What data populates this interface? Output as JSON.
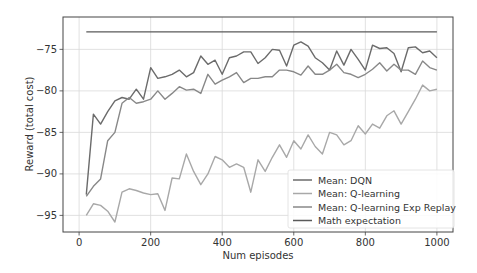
{
  "chart_data": {
    "type": "line",
    "title": "",
    "xlabel": "Num episodes",
    "ylabel": "Reward (total cost)",
    "xlim": [
      -45,
      1045
    ],
    "ylim": [
      -97,
      -71.1
    ],
    "xticks": [
      0,
      200,
      400,
      600,
      800,
      1000
    ],
    "yticks": [
      -95,
      -90,
      -85,
      -80,
      -75
    ],
    "grid": true,
    "legend_position": "lower right",
    "x": [
      20,
      40,
      60,
      80,
      100,
      120,
      140,
      160,
      180,
      200,
      220,
      240,
      260,
      280,
      300,
      320,
      340,
      360,
      380,
      400,
      420,
      440,
      460,
      480,
      500,
      520,
      540,
      560,
      580,
      600,
      620,
      640,
      660,
      680,
      700,
      720,
      740,
      760,
      780,
      800,
      820,
      840,
      860,
      880,
      900,
      920,
      940,
      960,
      980,
      1000
    ],
    "series": [
      {
        "name": "Mean: DQN",
        "color": "#6b6b6b",
        "values": [
          -92.5,
          -82.8,
          -84.0,
          -82.5,
          -81.2,
          -80.8,
          -81.0,
          -79.8,
          -81.0,
          -77.2,
          -78.5,
          -78.3,
          -78.0,
          -77.5,
          -78.3,
          -77.8,
          -75.8,
          -76.8,
          -76.3,
          -78.0,
          -76.0,
          -75.8,
          -75.3,
          -75.3,
          -76.7,
          -76.0,
          -75.0,
          -75.1,
          -77.0,
          -74.5,
          -74.1,
          -74.6,
          -76.0,
          -76.6,
          -77.5,
          -75.2,
          -76.9,
          -75.0,
          -76.2,
          -77.5,
          -74.5,
          -74.9,
          -74.8,
          -75.5,
          -77.7,
          -74.8,
          -74.7,
          -75.4,
          -75.2,
          -76.0
        ]
      },
      {
        "name": "Mean: Q-learning",
        "color": "#a8a8a8",
        "values": [
          -95.0,
          -93.6,
          -93.8,
          -94.5,
          -95.8,
          -92.2,
          -91.8,
          -92.0,
          -92.3,
          -92.5,
          -92.4,
          -94.4,
          -90.5,
          -90.6,
          -87.6,
          -89.7,
          -91.3,
          -90.0,
          -87.9,
          -88.3,
          -89.2,
          -88.8,
          -89.2,
          -92.2,
          -88.3,
          -89.7,
          -88.0,
          -86.5,
          -88.0,
          -86.0,
          -87.0,
          -85.3,
          -86.7,
          -87.6,
          -85.0,
          -85.3,
          -86.5,
          -86.0,
          -84.2,
          -85.2,
          -84.0,
          -84.5,
          -83.0,
          -82.4,
          -84.0,
          -82.5,
          -81.0,
          -79.3,
          -80.0,
          -79.8
        ]
      },
      {
        "name": "Mean: Q-learning Exp Replay",
        "color": "#888888",
        "values": [
          -92.7,
          -91.5,
          -90.6,
          -86.0,
          -85.0,
          -81.5,
          -80.8,
          -81.5,
          -81.3,
          -81.0,
          -80.0,
          -81.0,
          -80.3,
          -79.5,
          -79.9,
          -79.8,
          -80.3,
          -78.0,
          -79.2,
          -78.7,
          -78.3,
          -77.8,
          -79.0,
          -78.5,
          -78.5,
          -78.3,
          -78.3,
          -77.5,
          -77.5,
          -77.7,
          -78.1,
          -77.0,
          -78.0,
          -78.0,
          -77.5,
          -76.8,
          -77.8,
          -78.0,
          -78.4,
          -78.0,
          -77.4,
          -76.6,
          -77.6,
          -76.8,
          -77.5,
          -77.5,
          -78.0,
          -76.4,
          -77.2,
          -77.5
        ]
      },
      {
        "name": "Math expectation",
        "color": "#5a5a5a",
        "values": [
          -72.9,
          -72.9,
          -72.9,
          -72.9,
          -72.9,
          -72.9,
          -72.9,
          -72.9,
          -72.9,
          -72.9,
          -72.9,
          -72.9,
          -72.9,
          -72.9,
          -72.9,
          -72.9,
          -72.9,
          -72.9,
          -72.9,
          -72.9,
          -72.9,
          -72.9,
          -72.9,
          -72.9,
          -72.9,
          -72.9,
          -72.9,
          -72.9,
          -72.9,
          -72.9,
          -72.9,
          -72.9,
          -72.9,
          -72.9,
          -72.9,
          -72.9,
          -72.9,
          -72.9,
          -72.9,
          -72.9,
          -72.9,
          -72.9,
          -72.9,
          -72.9,
          -72.9,
          -72.9,
          -72.9,
          -72.9,
          -72.9,
          -72.9
        ]
      }
    ]
  }
}
